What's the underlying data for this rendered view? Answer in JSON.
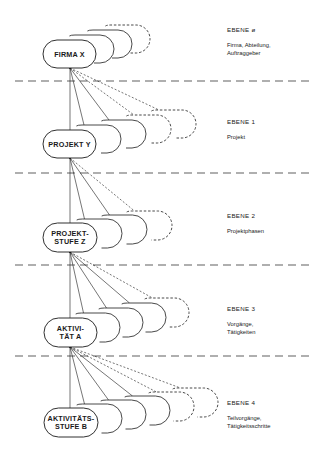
{
  "diagram": {
    "type": "hierarchy-levels",
    "levels": [
      {
        "level_title": "EBENE ø",
        "description_lines": [
          "Firma, Abteilung,",
          "Auftraggeber"
        ],
        "node_lines": [
          "FIRMA X"
        ],
        "solid_copies": 3,
        "dashed_copies": 1
      },
      {
        "level_title": "EBENE 1",
        "description_lines": [
          "Projekt"
        ],
        "node_lines": [
          "PROJEKT Y"
        ],
        "solid_copies": 3,
        "dashed_copies": 2
      },
      {
        "level_title": "EBENE 2",
        "description_lines": [
          "Projektphasen"
        ],
        "node_lines": [
          "PROJEKT-",
          "STUFE Z"
        ],
        "solid_copies": 3,
        "dashed_copies": 1
      },
      {
        "level_title": "EBENE 3",
        "description_lines": [
          "Vorgänge,",
          "Tätigkeiten"
        ],
        "node_lines": [
          "AKTIVI-",
          "TÄT A"
        ],
        "solid_copies": 4,
        "dashed_copies": 1
      },
      {
        "level_title": "EBENE 4",
        "description_lines": [
          "Teilvorgänge,",
          "Tätigkeitsschritte"
        ],
        "node_lines": [
          "AKTIVITÄTS-",
          "STUFE B"
        ],
        "solid_copies": 4,
        "dashed_copies": 2
      }
    ],
    "colors": {
      "line": "#1a1a1a",
      "background": "#ffffff"
    }
  }
}
